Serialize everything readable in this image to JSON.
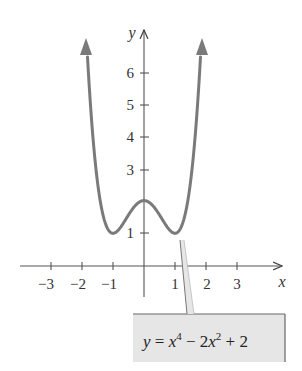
{
  "chart_data": {
    "type": "line",
    "title": "",
    "xlabel": "x",
    "ylabel": "y",
    "xlim": [
      -3.5,
      4.5
    ],
    "ylim": [
      -1,
      7
    ],
    "grid": false,
    "x_ticks": [
      -3,
      -2,
      -1,
      1,
      2,
      3
    ],
    "x_tick_labels": [
      "−3",
      "−2",
      "−1",
      "1",
      "2",
      "3"
    ],
    "y_ticks": [
      1,
      2,
      3,
      4,
      5,
      6
    ],
    "y_tick_labels": [
      "1",
      "",
      "3",
      "4",
      "5",
      "6"
    ],
    "series": [
      {
        "name": "y = x^4 − 2x^2 + 2",
        "function": "x^4 - 2x^2 + 2",
        "color": "#7a7a7a",
        "x": [
          -1.9,
          -1.5,
          -1.25,
          -1,
          -0.75,
          -0.5,
          -0.25,
          0,
          0.25,
          0.5,
          0.75,
          1,
          1.25,
          1.5,
          1.9
        ],
        "y": [
          7.81,
          2.56,
          1.32,
          1,
          1.19,
          1.56,
          1.88,
          2,
          1.88,
          1.56,
          1.19,
          1,
          1.32,
          2.56,
          7.81
        ],
        "arrows_both_ends": true
      }
    ],
    "annotations": [
      {
        "text": "y = x⁴ − 2x² + 2",
        "type": "callout",
        "points_to": [
          1.15,
          1.1
        ]
      }
    ],
    "key_points": {
      "local_max": [
        0,
        2
      ],
      "local_minima": [
        [
          -1,
          1
        ],
        [
          1,
          1
        ]
      ]
    }
  },
  "labels": {
    "x_axis": "x",
    "y_axis": "y",
    "x_ticks": [
      "−3",
      "−2",
      "−1",
      "1",
      "2",
      "3"
    ],
    "y_ticks": [
      "1",
      "3",
      "4",
      "5",
      "6"
    ],
    "equation": {
      "y": "y",
      "eq": " = ",
      "x1": "x",
      "exp1": "4",
      "minus": " − 2",
      "x2": "x",
      "exp2": "2",
      "plus": " + 2"
    }
  },
  "colors": {
    "curve": "#7a7a7a",
    "axis": "#555555",
    "label_box_fill": "#e6e6e6",
    "label_box_border": "#666666"
  }
}
